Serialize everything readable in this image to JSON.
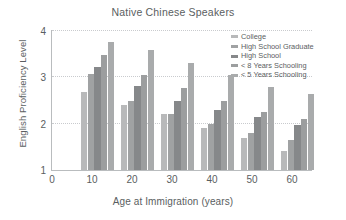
{
  "chart_data": {
    "type": "bar",
    "title": "Native Chinese Speakers",
    "xlabel": "Age at Immigration (years)",
    "ylabel": "English Proficiency Level",
    "categories": [
      "10",
      "20",
      "30",
      "40",
      "50",
      "60"
    ],
    "category_values": [
      10,
      20,
      30,
      40,
      50,
      60
    ],
    "xticks": [
      "0",
      "10",
      "20",
      "30",
      "40",
      "50",
      "60"
    ],
    "yticks": [
      "1",
      "2",
      "3",
      "4"
    ],
    "xlim": [
      0,
      65
    ],
    "ylim": [
      1,
      4
    ],
    "grid": "horizontal-dotted",
    "gridlines": [
      2,
      3,
      4
    ],
    "legend_position": "top-right",
    "series": [
      {
        "name": "College",
        "color": "#b8b9ba",
        "values": [
          2.68,
          2.4,
          2.2,
          1.9,
          1.7,
          1.4
        ]
      },
      {
        "name": "High School Graduate",
        "color": "#a0a2a3",
        "values": [
          3.08,
          2.5,
          2.2,
          2.0,
          1.8,
          1.65
        ]
      },
      {
        "name": "High School",
        "color": "#86888a",
        "values": [
          3.22,
          2.82,
          2.5,
          2.3,
          2.15,
          1.98
        ]
      },
      {
        "name": "< 8 Years Schooling",
        "color": "#9c9e9f",
        "values": [
          3.48,
          3.06,
          2.78,
          2.5,
          2.25,
          2.1
        ]
      },
      {
        "name": "< 5 Years Schooling",
        "color": "#a9abac",
        "values": [
          3.76,
          3.6,
          3.3,
          3.04,
          2.8,
          2.65
        ]
      }
    ]
  },
  "figure": {
    "background_color": "#ffffff",
    "axis_color": "#b9bcbe",
    "grid_color": "#c9cbce",
    "text_color": "#5a5e61"
  }
}
